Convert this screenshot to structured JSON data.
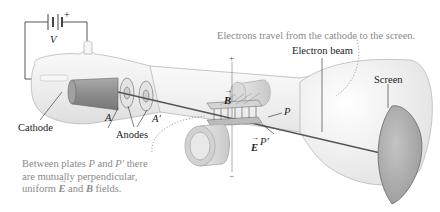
{
  "figure": {
    "colors": {
      "tube_fill": "#eeeeee",
      "tube_stroke": "#b5b5b5",
      "cathode": "#8f8f8f",
      "screen": "#a8a8a8",
      "beam": "#555555",
      "annotation_text": "#8a8a8a",
      "label_text": "#1a1a1a"
    }
  },
  "labels": {
    "battery_voltage": "V",
    "battery_plus": "+",
    "cathode": "Cathode",
    "anode_a": "A",
    "anode_a_prime": "A′",
    "anodes": "Anodes",
    "field_b": "B",
    "field_e": "E",
    "plate_p": "P",
    "plate_p_prime": "P′",
    "plus_sign": "+",
    "minus_sign": "−",
    "electron_beam": "Electron beam",
    "screen": "Screen"
  },
  "annotations": {
    "travel_note": "Electrons travel from the cathode to the screen.",
    "plates_note": {
      "line1_pre": "Between plates ",
      "line1_p": "P",
      "line1_mid": " and ",
      "line1_pp": "P′",
      "line1_post": " there",
      "line2": "are mutually perpendicular,",
      "line3_pre": "uniform ",
      "line3_e": "E",
      "line3_mid": " and ",
      "line3_b": "B",
      "line3_post": " fields."
    }
  }
}
